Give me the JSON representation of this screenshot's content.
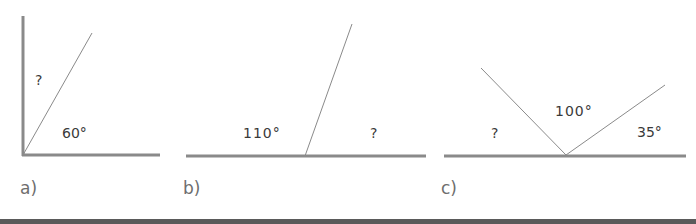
{
  "colors": {
    "baseline": "#8a8a8a",
    "ray": "#8a8a8a",
    "text": "#3a3a3a",
    "part_label": "#6e6e6e",
    "bottom_band": "#5a5a5a"
  },
  "figures": [
    {
      "part_label": "a)",
      "angles": [
        {
          "label": "?",
          "description": "angle between vertical line and ray"
        },
        {
          "label": "60°",
          "description": "angle between ray and horizontal line"
        }
      ]
    },
    {
      "part_label": "b)",
      "angles": [
        {
          "label": "110°",
          "description": "left angle on straight line"
        },
        {
          "label": "?",
          "description": "right angle on straight line"
        }
      ]
    },
    {
      "part_label": "c)",
      "angles": [
        {
          "label": "?",
          "description": "left angle on straight line"
        },
        {
          "label": "100°",
          "description": "middle angle between two rays"
        },
        {
          "label": "35°",
          "description": "right angle on straight line"
        }
      ]
    }
  ]
}
